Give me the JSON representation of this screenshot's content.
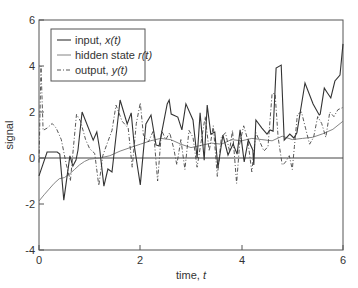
{
  "chart_data": {
    "type": "line",
    "title": "",
    "xlabel": "time, t",
    "ylabel": "signal",
    "xlim": [
      0,
      6
    ],
    "ylim": [
      -4,
      6
    ],
    "xticks": [
      0,
      2,
      4,
      6
    ],
    "yticks": [
      -4,
      -2,
      0,
      2,
      4,
      6
    ],
    "grid": false,
    "zero_line": true,
    "legend_position": "upper left",
    "legend": [
      "input, x(t)",
      "hidden state r(t)",
      "output, y(t)"
    ],
    "series": [
      {
        "name": "input, x(t)",
        "style": "solid",
        "color": "#333333",
        "x": [
          0.0,
          0.16,
          0.36,
          0.41,
          0.49,
          0.61,
          0.67,
          0.73,
          0.77,
          0.85,
          1.07,
          1.14,
          1.2,
          1.28,
          1.36,
          1.44,
          1.6,
          1.74,
          1.82,
          1.88,
          2.0,
          2.11,
          2.21,
          2.31,
          2.37,
          2.45,
          2.53,
          2.57,
          2.61,
          2.74,
          2.82,
          2.9,
          3.04,
          3.12,
          3.18,
          3.26,
          3.32,
          3.39,
          3.47,
          3.53,
          3.63,
          3.73,
          3.83,
          3.91,
          3.97,
          4.05,
          4.13,
          4.22,
          4.24,
          4.28,
          4.4,
          4.5,
          4.56,
          4.62,
          4.68,
          4.78,
          4.84,
          4.95,
          5.03,
          5.09,
          5.25,
          5.41,
          5.53,
          5.55,
          5.63,
          5.68,
          5.76,
          5.84,
          5.94,
          6.0
        ],
        "y": [
          -0.78,
          0.26,
          0.26,
          0.17,
          -1.83,
          0.09,
          -0.35,
          -0.09,
          0.35,
          2.0,
          0.78,
          1.13,
          0.35,
          -1.22,
          -0.48,
          -0.61,
          2.52,
          1.48,
          1.96,
          0.52,
          -1.17,
          1.48,
          1.87,
          0.57,
          0.52,
          1.43,
          2.35,
          2.52,
          1.91,
          1.78,
          1.22,
          2.35,
          1.65,
          0.0,
          1.96,
          -0.09,
          2.3,
          1.04,
          1.13,
          -0.43,
          1.0,
          0.13,
          0.61,
          0.17,
          1.22,
          -0.17,
          0.78,
          0.35,
          -0.3,
          1.65,
          1.3,
          1.04,
          1.22,
          1.17,
          3.91,
          4.04,
          0.78,
          1.04,
          0.87,
          1.09,
          3.26,
          2.35,
          1.87,
          1.91,
          3.04,
          2.87,
          2.61,
          3.35,
          3.61,
          4.96
        ]
      },
      {
        "name": "hidden state r(t)",
        "style": "solid-thin",
        "color": "#777777",
        "x": [
          0.0,
          0.1,
          0.2,
          0.3,
          0.4,
          0.5,
          0.6,
          0.7,
          0.8,
          0.9,
          1.0,
          1.2,
          1.4,
          1.6,
          1.8,
          2.0,
          2.2,
          2.4,
          2.6,
          2.8,
          3.0,
          3.2,
          3.4,
          3.6,
          3.8,
          4.0,
          4.2,
          4.4,
          4.6,
          4.8,
          5.0,
          5.2,
          5.4,
          5.6,
          5.8,
          6.0
        ],
        "y": [
          -1.87,
          -1.6,
          -1.35,
          -1.1,
          -0.9,
          -0.85,
          -0.7,
          -0.5,
          -0.3,
          -0.15,
          -0.05,
          0.0,
          0.1,
          0.3,
          0.45,
          0.6,
          0.75,
          0.85,
          0.8,
          0.6,
          0.45,
          0.55,
          0.65,
          0.6,
          0.8,
          0.75,
          0.85,
          0.8,
          0.75,
          0.95,
          0.8,
          0.85,
          0.9,
          1.05,
          1.25,
          1.6
        ]
      },
      {
        "name": "output, y(t)",
        "style": "dashdot",
        "color": "#444444",
        "x": [
          0.0,
          0.04,
          0.08,
          0.16,
          0.26,
          0.34,
          0.44,
          0.54,
          0.62,
          0.68,
          0.74,
          0.82,
          0.92,
          1.0,
          1.1,
          1.18,
          1.26,
          1.34,
          1.44,
          1.52,
          1.64,
          1.76,
          1.84,
          1.92,
          2.0,
          2.06,
          2.16,
          2.26,
          2.34,
          2.42,
          2.5,
          2.58,
          2.66,
          2.72,
          2.8,
          2.88,
          2.96,
          3.04,
          3.12,
          3.2,
          3.28,
          3.36,
          3.44,
          3.52,
          3.6,
          3.68,
          3.76,
          3.82,
          3.9,
          3.96,
          4.04,
          4.12,
          4.2,
          4.28,
          4.36,
          4.44,
          4.52,
          4.6,
          4.66,
          4.72,
          4.8,
          4.86,
          4.94,
          5.0,
          5.04,
          5.1,
          5.18,
          5.26,
          5.34,
          5.42,
          5.5,
          5.58,
          5.66,
          5.74,
          5.82,
          5.9,
          6.0
        ],
        "y": [
          -0.2,
          4.0,
          1.2,
          1.3,
          1.5,
          1.3,
          0.8,
          -0.3,
          -1.0,
          0.5,
          1.9,
          1.6,
          0.8,
          0.4,
          0.2,
          -1.2,
          0.1,
          0.6,
          1.2,
          2.3,
          1.6,
          1.3,
          -0.4,
          1.5,
          2.4,
          1.0,
          0.7,
          1.2,
          -1.0,
          1.2,
          0.8,
          1.1,
          0.4,
          -0.3,
          0.8,
          -0.5,
          1.2,
          0.9,
          -0.4,
          0.7,
          1.8,
          0.3,
          1.4,
          -0.8,
          0.9,
          1.1,
          0.3,
          1.2,
          -1.1,
          0.6,
          1.4,
          0.8,
          -0.6,
          1.1,
          0.7,
          0.3,
          0.5,
          2.8,
          2.8,
          0.9,
          -0.3,
          -0.2,
          0.1,
          -0.5,
          0.5,
          1.9,
          2.0,
          1.3,
          0.6,
          0.9,
          1.8,
          1.5,
          0.9,
          2.0,
          1.8,
          2.1,
          2.2
        ]
      }
    ]
  },
  "axes": {
    "xlabel_main": "time, ",
    "xlabel_var": "t",
    "ylabel": "signal",
    "xtick_labels": [
      "0",
      "2",
      "4",
      "6"
    ],
    "ytick_labels": [
      "6",
      "4",
      "2",
      "0",
      "-2",
      "-4"
    ]
  },
  "legend": {
    "items": [
      {
        "label_main": "input, ",
        "label_var": "x(t)"
      },
      {
        "label_main": "hidden state ",
        "label_var": "r(t)"
      },
      {
        "label_main": "output, ",
        "label_var": "y(t)"
      }
    ]
  }
}
